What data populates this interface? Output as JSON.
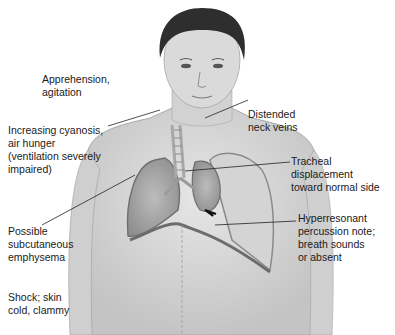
{
  "diagram": {
    "labels": [
      {
        "id": "apprehension",
        "text": "Apprehension,\nagitation"
      },
      {
        "id": "cyanosis",
        "text": "Increasing cyanosis,\nair hunger\n(ventilation severely\nimpaired)"
      },
      {
        "id": "neck-veins",
        "text": "Distended\nneck veins"
      },
      {
        "id": "tracheal",
        "text": "Tracheal displacement\ntoward normal side"
      },
      {
        "id": "emphysema",
        "text": "Possible\nsubcutaneous\nemphysema"
      },
      {
        "id": "hyperresonant",
        "text": "Hyperresonant\npercussion note;\nbreath sounds\nor absent"
      },
      {
        "id": "shock",
        "text": "Shock; skin\ncold, clammy"
      }
    ],
    "colors": {
      "skin": "#dcdcdc",
      "skin_shadow": "#bdbdbd",
      "hair": "#2b2b2b",
      "lung": "#a9a9a9",
      "pleura": "#8a8a8a",
      "leader_line": "#222222"
    }
  }
}
